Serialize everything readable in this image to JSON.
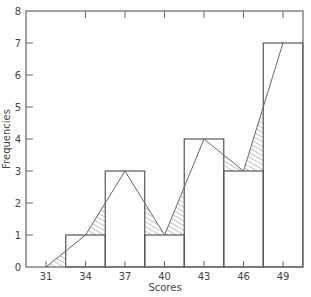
{
  "chart_data": {
    "type": "bar",
    "subtype": "histogram-with-frequency-polygon",
    "title": "",
    "xlabel": "Scores",
    "ylabel": "Frequencies",
    "categories": [
      "34",
      "37",
      "40",
      "43",
      "46",
      "49"
    ],
    "values": [
      1,
      3,
      1,
      4,
      3,
      7
    ],
    "x_ticks": [
      31,
      34,
      37,
      40,
      43,
      46,
      49
    ],
    "y_ticks": [
      0,
      1,
      2,
      3,
      4,
      5,
      6,
      7,
      8
    ],
    "ylim": [
      0,
      8
    ],
    "xlim": [
      30.5,
      51.5
    ],
    "bin_width": 3,
    "frequency_polygon": {
      "x": [
        31,
        34,
        37,
        40,
        43,
        46,
        49
      ],
      "y": [
        0,
        1,
        3,
        1,
        4,
        3,
        7
      ]
    },
    "hatched_regions": "area between frequency polygon and histogram where polygon lies above bars",
    "grid": false,
    "legend": null,
    "colors": {
      "line": "#555555",
      "axis": "#555555",
      "hatch": "#666666",
      "background": "#ffffff"
    }
  },
  "axes": {
    "x_title": "Scores",
    "y_title": "Frequencies",
    "x_tick_labels": [
      "31",
      "34",
      "37",
      "40",
      "43",
      "46",
      "49"
    ],
    "y_tick_labels": [
      "0",
      "1",
      "2",
      "3",
      "4",
      "5",
      "6",
      "7",
      "8"
    ]
  }
}
